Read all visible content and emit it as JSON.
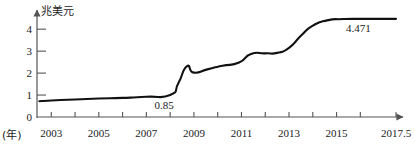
{
  "chart_data": {
    "type": "line",
    "title": "",
    "subtitle": "",
    "ylabel": "兆美元",
    "xlabel": "(年)",
    "ylim": [
      0,
      4.6
    ],
    "xlim": [
      2002.4,
      2017.5
    ],
    "yticks": [
      0,
      1,
      2,
      3,
      4
    ],
    "ytick_labels": [
      "0",
      "1",
      "2",
      "3",
      "4"
    ],
    "xticks": [
      2003,
      2004,
      2005,
      2006,
      2007,
      2008,
      2009,
      2010,
      2011,
      2012,
      2013,
      2014,
      2015,
      2016,
      2017.5
    ],
    "xtick_labels": [
      "2003",
      "",
      "2005",
      "",
      "2007",
      "",
      "2009",
      "",
      "2011",
      "",
      "2013",
      "",
      "2015",
      "",
      "2017.5"
    ],
    "grid": false,
    "legend": false,
    "line_color": "#111111",
    "axis_color": "#555555",
    "series": [
      {
        "name": "",
        "x": [
          2002.5,
          2003,
          2004,
          2005,
          2006,
          2007,
          2008,
          2008.35,
          2008.7,
          2009,
          2009.6,
          2010.2,
          2010.9,
          2011.4,
          2012,
          2012.5,
          2013,
          2013.5,
          2014,
          2014.6,
          2015.3,
          2016.2,
          2017.5
        ],
        "values": [
          0.72,
          0.75,
          0.8,
          0.84,
          0.87,
          0.92,
          1.0,
          1.55,
          2.31,
          2.02,
          2.18,
          2.33,
          2.48,
          2.87,
          2.9,
          2.92,
          3.15,
          3.7,
          4.16,
          4.4,
          4.46,
          4.47,
          4.471
        ]
      }
    ],
    "annotations": [
      {
        "name": "point-label-085",
        "text": "0.85",
        "x": 2007.85,
        "y": 0.52
      },
      {
        "name": "point-label-4471",
        "text": "4.471",
        "x": 2015.9,
        "y": 4.02
      }
    ]
  }
}
